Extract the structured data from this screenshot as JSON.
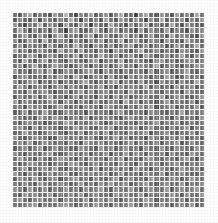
{
  "figure": {
    "background_color": "#ffffff",
    "plot_background_color": "#f2f2f2",
    "gridline_color": "#ffffff",
    "title": "",
    "subtitle": "",
    "caption": ""
  },
  "chart_data": {
    "type": "heatmap",
    "title": "",
    "xlabel": "",
    "ylabel": "",
    "colormap": "gray",
    "grid": true,
    "legend": "none",
    "xticklabels": [],
    "yticklabels": [],
    "n_rows": 38,
    "n_cols": 38,
    "vmin": 0,
    "vmax": 255,
    "value_range_note": "grayscale intensity 0 (black) to 255 (white)",
    "values": [
      [
        120,
        92,
        148,
        176,
        96,
        132,
        108,
        84,
        160,
        128,
        188,
        104,
        72,
        140,
        116,
        168,
        96,
        124,
        152,
        88,
        136,
        180,
        100,
        116,
        64,
        144,
        172,
        108,
        92,
        156,
        128,
        84,
        164,
        112,
        140,
        96,
        176,
        120
      ],
      [
        88,
        140,
        108,
        92,
        164,
        76,
        152,
        120,
        96,
        144,
        112,
        180,
        128,
        68,
        148,
        104,
        136,
        92,
        172,
        116,
        84,
        160,
        132,
        100,
        156,
        120,
        72,
        144,
        108,
        184,
        96,
        128,
        116,
        152,
        80,
        140,
        104,
        160
      ],
      [
        156,
        104,
        72,
        132,
        116,
        188,
        96,
        148,
        124,
        80,
        168,
        112,
        92,
        160,
        136,
        64,
        144,
        108,
        96,
        180,
        128,
        116,
        76,
        152,
        104,
        140,
        168,
        88,
        132,
        112,
        96,
        176,
        120,
        84,
        148,
        128,
        108,
        92
      ],
      [
        112,
        176,
        128,
        84,
        148,
        104,
        136,
        92,
        172,
        116,
        60,
        144,
        164,
        108,
        96,
        128,
        184,
        120,
        88,
        140,
        156,
        100,
        132,
        112,
        76,
        160,
        96,
        148,
        124,
        104,
        168,
        92,
        136,
        116,
        80,
        152,
        128,
        144
      ],
      [
        96,
        128,
        164,
        112,
        88,
        156,
        120,
        76,
        140,
        184,
        104,
        132,
        116,
        92,
        148,
        168,
        80,
        124,
        152,
        108,
        96,
        136,
        172,
        112,
        144,
        88,
        120,
        160,
        104,
        128,
        92,
        176,
        116,
        148,
        132,
        100,
        84,
        156
      ],
      [
        144,
        88,
        112,
        168,
        132,
        96,
        180,
        116,
        104,
        148,
        128,
        72,
        152,
        120,
        88,
        140,
        116,
        160,
        92,
        132,
        108,
        176,
        84,
        128,
        164,
        112,
        96,
        144,
        132,
        80,
        156,
        120,
        108,
        92,
        172,
        136,
        116,
        104
      ],
      [
        108,
        152,
        92,
        136,
        116,
        128,
        88,
        164,
        120,
        96,
        144,
        108,
        180,
        132,
        112,
        76,
        156,
        128,
        104,
        148,
        92,
        120,
        136,
        168,
        88,
        116,
        152,
        100,
        128,
        144,
        84,
        112,
        160,
        132,
        96,
        124,
        176,
        112
      ],
      [
        172,
        116,
        140,
        96,
        108,
        152,
        132,
        112,
        84,
        176,
        120,
        148,
        96,
        164,
        108,
        128,
        92,
        144,
        116,
        72,
        160,
        136,
        112,
        88,
        132,
        180,
        104,
        120,
        148,
        96,
        128,
        116,
        84,
        152,
        140,
        108,
        92,
        164
      ],
      [
        92,
        132,
        108,
        160,
        144,
        84,
        116,
        152,
        128,
        96,
        136,
        112,
        168,
        88,
        140,
        120,
        104,
        176,
        132,
        116,
        148,
        92,
        128,
        156,
        112,
        84,
        164,
        136,
        96,
        120,
        144,
        108,
        128,
        172,
        116,
        88,
        152,
        120
      ],
      [
        128,
        96,
        176,
        120,
        88,
        140,
        168,
        104,
        148,
        116,
        92,
        156,
        128,
        112,
        96,
        144,
        160,
        84,
        120,
        136,
        108,
        172,
        92,
        116,
        148,
        128,
        100,
        88,
        152,
        164,
        112,
        132,
        96,
        120,
        144,
        156,
        104,
        136
      ],
      [
        116,
        148,
        84,
        132,
        172,
        112,
        96,
        128,
        160,
        144,
        108,
        88,
        116,
        152,
        124,
        92,
        136,
        112,
        148,
        96,
        128,
        168,
        116,
        140,
        84,
        152,
        132,
        112,
        176,
        96,
        120,
        148,
        108,
        92,
        128,
        116,
        160,
        144
      ],
      [
        160,
        112,
        128,
        92,
        136,
        156,
        120,
        172,
        88,
        104,
        148,
        132,
        96,
        116,
        144,
        168,
        112,
        84,
        152,
        128,
        116,
        96,
        140,
        108,
        132,
        120,
        88,
        160,
        104,
        136,
        148,
        92,
        116,
        128,
        172,
        112,
        96,
        140
      ],
      [
        88,
        136,
        152,
        116,
        104,
        128,
        92,
        144,
        116,
        164,
        120,
        96,
        180,
        132,
        84,
        112,
        148,
        136,
        96,
        160,
        104,
        120,
        88,
        152,
        116,
        144,
        128,
        96,
        132,
        112,
        168,
        140,
        88,
        104,
        156,
        120,
        132,
        96
      ],
      [
        144,
        96,
        116,
        148,
        160,
        88,
        132,
        108,
        152,
        92,
        136,
        116,
        104,
        148,
        172,
        120,
        88,
        128,
        112,
        144,
        168,
        92,
        136,
        120,
        96,
        160,
        108,
        128,
        84,
        152,
        116,
        132,
        96,
        148,
        120,
        104,
        176,
        128
      ],
      [
        112,
        168,
        132,
        88,
        120,
        144,
        116,
        96,
        128,
        156,
        104,
        148,
        132,
        112,
        92,
        136,
        120,
        164,
        96,
        128,
        84,
        152,
        116,
        140,
        132,
        112,
        176,
        96,
        144,
        108,
        120,
        88,
        160,
        116,
        132,
        148,
        92,
        120
      ],
      [
        132,
        116,
        96,
        164,
        108,
        136,
        152,
        120,
        84,
        116,
        144,
        92,
        128,
        160,
        112,
        148,
        96,
        132,
        144,
        108,
        120,
        136,
        92,
        168,
        128,
        104,
        116,
        152,
        120,
        96,
        140,
        112,
        128,
        84,
        156,
        132,
        116,
        104
      ],
      [
        96,
        144,
        120,
        112,
        152,
        96,
        128,
        176,
        108,
        132,
        88,
        120,
        156,
        104,
        136,
        116,
        84,
        148,
        128,
        92,
        160,
        112,
        144,
        96,
        120,
        136,
        148,
        112,
        108,
        168,
        92,
        120,
        152,
        136,
        104,
        96,
        128,
        160
      ],
      [
        164,
        104,
        148,
        132,
        96,
        120,
        112,
        148,
        136,
        92,
        160,
        128,
        88,
        144,
        120,
        96,
        152,
        116,
        104,
        136,
        128,
        84,
        172,
        120,
        148,
        92,
        132,
        116,
        96,
        128,
        160,
        108,
        136,
        120,
        112,
        148,
        84,
        132
      ],
      [
        120,
        132,
        88,
        156,
        128,
        144,
        104,
        96,
        120,
        168,
        116,
        108,
        132,
        92,
        148,
        136,
        120,
        88,
        160,
        144,
        112,
        128,
        96,
        136,
        108,
        152,
        120,
        164,
        88,
        116,
        132,
        148,
        96,
        120,
        128,
        112,
        156,
        92
      ],
      [
        92,
        116,
        160,
        96,
        140,
        112,
        168,
        128,
        92,
        104,
        148,
        136,
        116,
        128,
        84,
        152,
        108,
        132,
        120,
        96,
        140,
        160,
        116,
        104,
        132,
        120,
        88,
        148,
        136,
        112,
        96,
        128,
        116,
        172,
        104,
        144,
        120,
        136
      ],
      [
        148,
        128,
        108,
        120,
        92,
        164,
        132,
        116,
        152,
        136,
        96,
        120,
        144,
        108,
        160,
        92,
        128,
        116,
        148,
        132,
        104,
        88,
        136,
        156,
        120,
        112,
        148,
        96,
        128,
        140,
        116,
        84,
        152,
        108,
        132,
        120,
        96,
        160
      ],
      [
        116,
        96,
        136,
        148,
        116,
        128,
        88,
        104,
        128,
        120,
        172,
        148,
        96,
        132,
        112,
        136,
        160,
        120,
        88,
        116,
        152,
        132,
        108,
        120,
        96,
        144,
        116,
        128,
        160,
        104,
        132,
        120,
        148,
        96,
        116,
        136,
        112,
        128
      ],
      [
        136,
        152,
        120,
        84,
        160,
        108,
        144,
        132,
        116,
        96,
        128,
        112,
        164,
        120,
        148,
        104,
        96,
        144,
        132,
        160,
        88,
        120,
        116,
        136,
        148,
        92,
        128,
        156,
        112,
        120,
        96,
        144,
        108,
        132,
        160,
        88,
        136,
        116
      ],
      [
        104,
        120,
        168,
        132,
        112,
        96,
        120,
        152,
        140,
        116,
        88,
        136,
        108,
        156,
        92,
        128,
        144,
        112,
        160,
        96,
        132,
        120,
        104,
        148,
        116,
        136,
        160,
        88,
        120,
        132,
        148,
        112,
        96,
        128,
        120,
        152,
        104,
        144
      ],
      [
        156,
        108,
        92,
        120,
        148,
        136,
        116,
        88,
        96,
        160,
        132,
        120,
        144,
        112,
        128,
        148,
        104,
        92,
        136,
        120,
        168,
        116,
        144,
        96,
        128,
        112,
        84,
        152,
        136,
        108,
        120,
        148,
        116,
        160,
        92,
        120,
        132,
        96
      ],
      [
        120,
        144,
        116,
        160,
        96,
        120,
        152,
        132,
        112,
        128,
        96,
        148,
        116,
        84,
        160,
        136,
        120,
        148,
        108,
        132,
        116,
        96,
        128,
        152,
        104,
        144,
        120,
        116,
        148,
        96,
        132,
        128,
        160,
        88,
        116,
        148,
        120,
        108
      ],
      [
        92,
        128,
        148,
        104,
        132,
        160,
        88,
        116,
        148,
        120,
        136,
        108,
        96,
        152,
        132,
        116,
        88,
        160,
        120,
        144,
        96,
        128,
        152,
        116,
        132,
        88,
        148,
        120,
        108,
        160,
        116,
        96,
        144,
        132,
        120,
        104,
        156,
        128
      ],
      [
        148,
        116,
        96,
        136,
        120,
        108,
        144,
        160,
        104,
        96,
        120,
        148,
        132,
        116,
        144,
        96,
        128,
        120,
        152,
        88,
        132,
        116,
        160,
        104,
        148,
        132,
        96,
        136,
        120,
        144,
        88,
        152,
        116,
        120,
        96,
        160,
        132,
        112
      ],
      [
        116,
        160,
        132,
        120,
        88,
        148,
        116,
        96,
        132,
        160,
        144,
        120,
        88,
        136,
        104,
        152,
        116,
        132,
        96,
        148,
        120,
        160,
        92,
        132,
        116,
        96,
        144,
        148,
        120,
        108,
        132,
        120,
        96,
        144,
        160,
        116,
        88,
        136
      ],
      [
        132,
        96,
        120,
        152,
        144,
        116,
        128,
        88,
        120,
        136,
        108,
        160,
        148,
        120,
        92,
        128,
        144,
        116,
        136,
        120,
        96,
        148,
        132,
        120,
        88,
        160,
        116,
        128,
        144,
        96,
        120,
        136,
        152,
        116,
        104,
        132,
        120,
        148
      ],
      [
        104,
        136,
        160,
        96,
        116,
        132,
        148,
        120,
        160,
        112,
        96,
        132,
        120,
        148,
        136,
        104,
        160,
        92,
        128,
        116,
        148,
        120,
        136,
        96,
        160,
        128,
        120,
        88,
        132,
        148,
        116,
        96,
        128,
        160,
        132,
        120,
        144,
        96
      ],
      [
        160,
        120,
        88,
        144,
        132,
        96,
        120,
        148,
        116,
        136,
        160,
        104,
        92,
        132,
        116,
        148,
        120,
        136,
        148,
        96,
        116,
        160,
        104,
        128,
        120,
        96,
        148,
        132,
        116,
        160,
        88,
        132,
        120,
        148,
        116,
        104,
        96,
        132
      ],
      [
        96,
        148,
        132,
        116,
        160,
        120,
        96,
        132,
        148,
        88,
        120,
        144,
        160,
        116,
        132,
        96,
        148,
        120,
        104,
        136,
        160,
        92,
        132,
        148,
        116,
        120,
        96,
        160,
        132,
        116,
        120,
        148,
        136,
        96,
        120,
        160,
        132,
        116
      ],
      [
        128,
        116,
        148,
        120,
        96,
        160,
        136,
        116,
        120,
        148,
        132,
        96,
        116,
        160,
        104,
        132,
        96,
        148,
        120,
        160,
        116,
        132,
        148,
        96,
        120,
        136,
        160,
        116,
        96,
        132,
        148,
        120,
        116,
        160,
        96,
        132,
        120,
        148
      ],
      [
        148,
        132,
        96,
        160,
        120,
        116,
        148,
        96,
        132,
        120,
        160,
        116,
        132,
        96,
        148,
        120,
        136,
        160,
        116,
        96,
        148,
        132,
        120,
        160,
        116,
        96,
        132,
        148,
        120,
        116,
        160,
        96,
        132,
        148,
        120,
        136,
        160,
        116
      ],
      [
        116,
        96,
        160,
        132,
        148,
        120,
        116,
        160,
        96,
        132,
        120,
        148,
        116,
        160,
        96,
        132,
        148,
        120,
        116,
        96,
        160,
        132,
        148,
        120,
        116,
        160,
        96,
        132,
        120,
        148,
        116,
        160,
        132,
        96,
        148,
        120,
        116,
        160
      ],
      [
        132,
        160,
        116,
        96,
        132,
        148,
        120,
        116,
        160,
        96,
        148,
        132,
        120,
        116,
        160,
        96,
        132,
        148,
        120,
        160,
        116,
        96,
        132,
        148,
        120,
        116,
        160,
        148,
        96,
        132,
        120,
        160,
        116,
        148,
        96,
        132,
        120,
        116
      ],
      [
        120,
        116,
        132,
        148,
        160,
        96,
        132,
        120,
        116,
        148,
        160,
        132,
        96,
        120,
        148,
        116,
        160,
        132,
        120,
        96,
        148,
        116,
        132,
        160,
        120,
        96,
        148,
        132,
        116,
        160,
        120,
        96,
        132,
        148,
        116,
        160,
        96,
        120
      ]
    ]
  }
}
